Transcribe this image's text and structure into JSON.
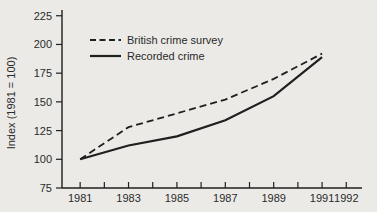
{
  "figure": {
    "background_color": "#ebeae7",
    "line_color": "#1f1f1f",
    "text_color": "#2a2a2a"
  },
  "chart_data": {
    "type": "line",
    "title": "",
    "xlabel": "",
    "ylabel": "Index (1981 = 100)",
    "grid": false,
    "legend": {
      "position": "top-left-inside",
      "entries": [
        {
          "label": "British crime survey",
          "line_style": "dashed"
        },
        {
          "label": "Recorded crime",
          "line_style": "solid"
        }
      ]
    },
    "y_ticks": [
      75,
      100,
      125,
      150,
      175,
      200,
      225
    ],
    "x_ticks_years": [
      1981,
      1982,
      1983,
      1984,
      1985,
      1986,
      1987,
      1988,
      1989,
      1990,
      1991,
      1992
    ],
    "x_tick_label_years": [
      1981,
      1983,
      1985,
      1987,
      1989,
      1991,
      1992
    ],
    "xlim": [
      1980.25,
      1992.65
    ],
    "ylim": [
      75,
      230
    ],
    "plot_box": {
      "left": 62,
      "right": 362,
      "top": 10,
      "bottom": 188
    },
    "series": [
      {
        "name": "British crime survey",
        "line_style": "dashed",
        "x": [
          1981,
          1983,
          1985,
          1987,
          1989,
          1991
        ],
        "values": [
          100,
          128,
          140,
          152,
          170,
          192
        ]
      },
      {
        "name": "Recorded crime",
        "line_style": "solid",
        "x": [
          1981,
          1983,
          1985,
          1987,
          1989,
          1991
        ],
        "values": [
          100,
          112,
          120,
          134,
          155,
          189
        ]
      }
    ]
  }
}
